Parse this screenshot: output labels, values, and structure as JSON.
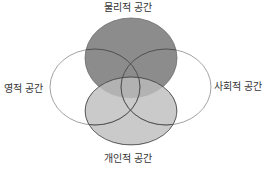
{
  "diagram": {
    "type": "venn",
    "sets": [
      {
        "id": "physical",
        "label": "물리적 공간",
        "position": "top",
        "fill": "#8c8c8c"
      },
      {
        "id": "spiritual",
        "label": "영적 공간",
        "position": "left",
        "fill": "none"
      },
      {
        "id": "social",
        "label": "사회적 공간",
        "position": "right",
        "fill": "none"
      },
      {
        "id": "personal",
        "label": "개인적 공간",
        "position": "bottom",
        "fill": "#c6c6c6"
      }
    ],
    "colors": {
      "stroke": "#555555",
      "outline_stroke": "#999999",
      "text": "#333333",
      "background": "#ffffff"
    }
  }
}
